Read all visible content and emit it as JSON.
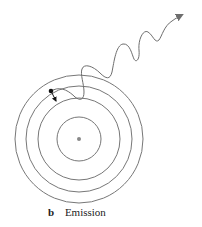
{
  "figure": {
    "caption_letter": "b",
    "caption_text": "Emission"
  },
  "atom": {
    "nucleus": {
      "cx": 79,
      "cy": 139,
      "r": 2,
      "color": "#888888"
    },
    "orbits": [
      {
        "r": 22
      },
      {
        "r": 41
      },
      {
        "r": 53
      },
      {
        "r": 64
      }
    ],
    "orbit_color": "#777777",
    "electron": {
      "cx": 51,
      "cy": 91,
      "r": 2.3,
      "color": "#111111"
    }
  },
  "photon": {
    "color": "#6e6e6e"
  }
}
